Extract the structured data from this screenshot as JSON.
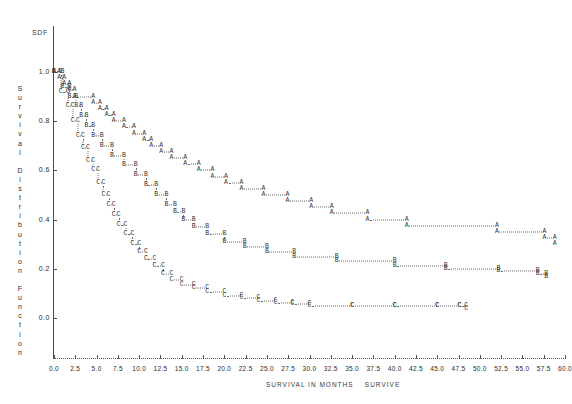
{
  "chart_data": {
    "type": "line",
    "title": "SDF",
    "xlabel": "SURVIVAL IN MONTHS",
    "legend_label": "SURVIVE",
    "ylabel": "Survival Distribution Function",
    "xlim": [
      0.0,
      60.0
    ],
    "ylim": [
      0.0,
      1.0
    ],
    "xticks": [
      "0.0",
      "2.5",
      "5.0",
      "7.5",
      "10.0",
      "12.5",
      "15.0",
      "17.5",
      "20.0",
      "22.5",
      "25.0",
      "27.5",
      "30.0",
      "32.5",
      "35.0",
      "37.5",
      "40.0",
      "42.5",
      "45.0",
      "47.5",
      "50.0",
      "52.5",
      "55.0",
      "57.5",
      "60.0"
    ],
    "yticks": [
      "1.0",
      "0.8",
      "0.6",
      "0.4",
      "0.2",
      "0.0"
    ],
    "grid": false,
    "legend_position": "none",
    "plot_style": "character-step-function",
    "series": [
      {
        "name": "A",
        "symbol": "A",
        "x": [
          0.0,
          0.6,
          1.2,
          1.8,
          2.4,
          4.6,
          5.4,
          6.2,
          7.0,
          8.2,
          9.4,
          10.6,
          11.4,
          12.6,
          13.8,
          15.4,
          17.0,
          18.6,
          20.2,
          22.0,
          24.6,
          27.4,
          30.2,
          32.6,
          36.8,
          41.4,
          52.0,
          57.6,
          58.8
        ],
        "y": [
          1.0,
          0.975,
          0.95,
          0.925,
          0.9,
          0.875,
          0.85,
          0.825,
          0.8,
          0.775,
          0.75,
          0.725,
          0.7,
          0.675,
          0.65,
          0.625,
          0.6,
          0.575,
          0.55,
          0.525,
          0.5,
          0.475,
          0.45,
          0.425,
          0.4,
          0.375,
          0.35,
          0.325,
          0.3
        ]
      },
      {
        "name": "B",
        "symbol": "B",
        "x": [
          0.0,
          1.0,
          1.8,
          2.6,
          3.2,
          3.8,
          4.6,
          5.6,
          6.8,
          8.2,
          9.6,
          10.8,
          12.0,
          13.2,
          14.2,
          15.2,
          16.4,
          18.0,
          20.0,
          22.4,
          25.0,
          28.2,
          33.2,
          40.0,
          46.0,
          52.2,
          56.8,
          57.8
        ],
        "y": [
          1.0,
          0.94,
          0.9,
          0.86,
          0.82,
          0.78,
          0.74,
          0.7,
          0.66,
          0.62,
          0.58,
          0.54,
          0.5,
          0.46,
          0.43,
          0.4,
          0.37,
          0.34,
          0.31,
          0.29,
          0.27,
          0.25,
          0.23,
          0.21,
          0.2,
          0.19,
          0.18,
          0.165
        ]
      },
      {
        "name": "C",
        "symbol": "C",
        "x": [
          0.0,
          0.8,
          1.6,
          2.2,
          2.8,
          3.4,
          4.0,
          4.6,
          5.2,
          5.8,
          6.4,
          7.0,
          7.6,
          8.4,
          9.2,
          10.0,
          10.8,
          11.8,
          12.8,
          13.8,
          15.0,
          16.4,
          18.0,
          20.0,
          22.0,
          24.0,
          26.0,
          28.0,
          30.0,
          35.0,
          40.0,
          45.0,
          47.6,
          48.4
        ],
        "y": [
          1.0,
          0.92,
          0.86,
          0.8,
          0.74,
          0.69,
          0.64,
          0.6,
          0.55,
          0.5,
          0.46,
          0.42,
          0.38,
          0.34,
          0.3,
          0.27,
          0.24,
          0.21,
          0.18,
          0.155,
          0.135,
          0.12,
          0.105,
          0.09,
          0.08,
          0.07,
          0.06,
          0.055,
          0.05,
          0.05,
          0.05,
          0.05,
          0.05,
          0.035
        ]
      }
    ]
  },
  "axis": {
    "y_caption_letters": [
      "S",
      "u",
      "r",
      "v",
      "i",
      "v",
      "a",
      "l",
      "",
      "D",
      "i",
      "s",
      "t",
      "r",
      "i",
      "b",
      "u",
      "t",
      "i",
      "o",
      "n",
      "",
      "F",
      "u",
      "n",
      "c",
      "t",
      "i",
      "o",
      "n"
    ]
  }
}
